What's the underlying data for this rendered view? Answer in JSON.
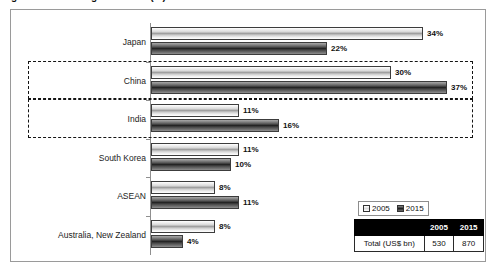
{
  "title_strip": {
    "text": "Figure: Share of regional trade (%)"
  },
  "chart_data": {
    "type": "bar",
    "orientation": "horizontal",
    "title": "",
    "xlabel": "",
    "ylabel": "",
    "xlim": [
      0,
      40
    ],
    "grid": false,
    "legend_position": "bottom-right",
    "value_suffix": "%",
    "categories": [
      "Japan",
      "China",
      "India",
      "South Korea",
      "ASEAN",
      "Australia, New Zealand"
    ],
    "series": [
      {
        "name": "2005",
        "values": [
          34,
          30,
          11,
          11,
          8,
          8
        ],
        "labels": [
          "34%",
          "30%",
          "11%",
          "11%",
          "8%",
          "8%"
        ]
      },
      {
        "name": "2015",
        "values": [
          22,
          37,
          16,
          10,
          11,
          4
        ],
        "labels": [
          "22%",
          "37%",
          "16%",
          "10%",
          "11%",
          "4%"
        ]
      }
    ],
    "highlighted_categories": [
      "China",
      "India"
    ]
  },
  "legend": {
    "items": [
      {
        "label": "2005"
      },
      {
        "label": "2015"
      }
    ]
  },
  "totals_table": {
    "corner_label": "",
    "columns": [
      "2005",
      "2015"
    ],
    "rows": [
      {
        "label": "Total (US$ bn)",
        "values": [
          "530",
          "870"
        ]
      }
    ]
  },
  "colors": {
    "frame": "#9a9a9a",
    "axis": "#8f8f8f",
    "bar_2005": "#e8e8e8",
    "bar_2015": "#3a3a3a",
    "highlight_border": "#141414",
    "table_header_bg": "#000000",
    "table_header_text": "#ffffff"
  }
}
